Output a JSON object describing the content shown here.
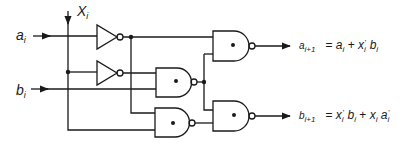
{
  "diagram": {
    "stroke_color": "#1a1a1a",
    "background": "#ffffff",
    "inputs": {
      "a": {
        "base": "a",
        "sub": "i"
      },
      "b": {
        "base": "b",
        "sub": "i"
      },
      "x": {
        "base": "X",
        "sub": "i"
      }
    },
    "outputs": {
      "a_next": {
        "name_base": "a",
        "name_sub": "i+1",
        "equals": "=",
        "t1_base": "a",
        "t1_sub": "i",
        "plus": "+",
        "t2_base": "x",
        "t2_sub": "i",
        "t2_prime": "'",
        "t3_base": "b",
        "t3_sub": "i"
      },
      "b_next": {
        "name_base": "b",
        "name_sub": "i+1",
        "equals": "=",
        "t1_base": "x",
        "t1_sub": "i",
        "t1_prime": "'",
        "t2_base": "b",
        "t2_sub": "i",
        "plus": "+",
        "t3_base": "x",
        "t3_sub": "i",
        "t4_base": "a",
        "t4_sub": "i",
        "t4_prime": "'"
      }
    },
    "gates": [
      {
        "id": "inv-1",
        "type": "NOT",
        "input": "a_i",
        "output": "a_i'"
      },
      {
        "id": "inv-2",
        "type": "NOT",
        "input": "X_i",
        "output": "X_i'"
      },
      {
        "id": "nand-1",
        "type": "NAND",
        "inputs": [
          "a_i'",
          "nand-2"
        ],
        "output": "a_{i+1}"
      },
      {
        "id": "nand-2",
        "type": "NAND",
        "inputs": [
          "X_i'",
          "b_i"
        ]
      },
      {
        "id": "nand-3",
        "type": "NAND",
        "inputs": [
          "a_i'",
          "X_i"
        ]
      },
      {
        "id": "nand-4",
        "type": "NAND",
        "inputs": [
          "nand-2",
          "nand-3"
        ],
        "output": "b_{i+1}"
      }
    ]
  }
}
